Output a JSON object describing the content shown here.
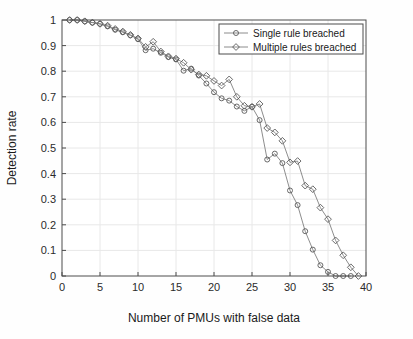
{
  "chart_data": {
    "type": "line",
    "title": "",
    "xlabel": "Number of PMUs with false data",
    "ylabel": "Detection rate",
    "xlim": [
      0,
      40
    ],
    "ylim": [
      0,
      1
    ],
    "xticks": [
      0,
      5,
      10,
      15,
      20,
      25,
      30,
      35,
      40
    ],
    "yticks": [
      0,
      0.1,
      0.2,
      0.3,
      0.4,
      0.5,
      0.6,
      0.7,
      0.8,
      0.9,
      1
    ],
    "xtick_labels": [
      "0",
      "5",
      "10",
      "15",
      "20",
      "25",
      "30",
      "35",
      "40"
    ],
    "ytick_labels": [
      "0",
      "0.1",
      "0.2",
      "0.3",
      "0.4",
      "0.5",
      "0.6",
      "0.7",
      "0.8",
      "0.9",
      "1"
    ],
    "grid": true,
    "legend_position": "top-right",
    "line_color": "#808080",
    "marker_color": "#595959",
    "grid_color": "#e8e8e8",
    "axis_color": "#4d4d4d",
    "series": [
      {
        "name": "Single rule breached",
        "marker": "circle",
        "x": [
          1,
          2,
          3,
          4,
          5,
          6,
          7,
          8,
          9,
          10,
          11,
          12,
          13,
          14,
          15,
          16,
          17,
          18,
          19,
          20,
          21,
          22,
          23,
          24,
          25,
          26,
          27,
          28,
          29,
          30,
          31,
          32,
          33,
          34,
          35,
          36,
          37,
          38
        ],
        "values": [
          1.0,
          1.0,
          0.995,
          0.99,
          0.985,
          0.975,
          0.962,
          0.952,
          0.94,
          0.925,
          0.882,
          0.888,
          0.872,
          0.855,
          0.846,
          0.802,
          0.81,
          0.783,
          0.752,
          0.718,
          0.694,
          0.685,
          0.662,
          0.645,
          0.661,
          0.609,
          0.455,
          0.478,
          0.441,
          0.334,
          0.277,
          0.175,
          0.103,
          0.042,
          0.016,
          0.0,
          0.0,
          0.0
        ]
      },
      {
        "name": "Multiple rules breached",
        "marker": "diamond",
        "x": [
          1,
          2,
          3,
          4,
          5,
          6,
          7,
          8,
          9,
          10,
          11,
          12,
          13,
          14,
          15,
          16,
          17,
          18,
          19,
          20,
          21,
          22,
          23,
          24,
          25,
          26,
          27,
          28,
          29,
          30,
          31,
          32,
          33,
          34,
          35,
          36,
          37,
          38,
          39
        ],
        "values": [
          1.0,
          1.0,
          0.995,
          0.99,
          0.985,
          0.978,
          0.965,
          0.955,
          0.942,
          0.928,
          0.895,
          0.915,
          0.877,
          0.858,
          0.849,
          0.833,
          0.806,
          0.787,
          0.782,
          0.762,
          0.744,
          0.768,
          0.7,
          0.665,
          0.661,
          0.672,
          0.578,
          0.561,
          0.528,
          0.444,
          0.449,
          0.353,
          0.339,
          0.267,
          0.222,
          0.139,
          0.081,
          0.034,
          0.0
        ]
      }
    ]
  },
  "legend": {
    "items": [
      {
        "label": "Single rule breached",
        "marker": "circle"
      },
      {
        "label": "Multiple rules breached",
        "marker": "diamond"
      }
    ]
  }
}
